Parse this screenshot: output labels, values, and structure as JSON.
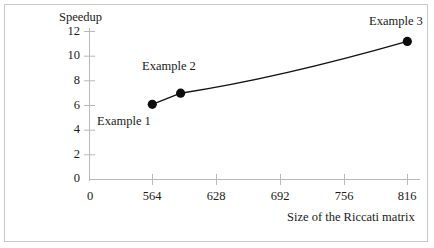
{
  "chart_data": {
    "type": "line",
    "title": "",
    "xlabel": "Size of the Riccati matrix",
    "ylabel": "Speedup",
    "xlim": [
      0,
      848
    ],
    "ylim": [
      0,
      12
    ],
    "grid": false,
    "legend": "none",
    "xticks": [
      "0",
      "564",
      "628",
      "692",
      "756",
      "816"
    ],
    "xtick_values": [
      0,
      564,
      628,
      692,
      756,
      816
    ],
    "yticks": [
      "0",
      "2",
      "4",
      "6",
      "8",
      "10",
      "12"
    ],
    "ytick_values": [
      0,
      2,
      4,
      6,
      8,
      10,
      12
    ],
    "x": [
      564,
      592,
      816
    ],
    "values": [
      6.1,
      7.0,
      11.2
    ],
    "point_labels": [
      "Example 1",
      "Example 2",
      "Example 3"
    ],
    "marker": "filled-circle",
    "marker_color": "#000000",
    "line_color": "#000000",
    "axis_color": "#b3b3b3",
    "border_color": "#c9c9c9",
    "background": "#ffffff"
  },
  "annotations": {
    "example1": "Example 1",
    "example2": "Example 2",
    "example3": "Example 3"
  },
  "axes": {
    "y_title": "Speedup",
    "x_title": "Size of the Riccati matrix"
  }
}
